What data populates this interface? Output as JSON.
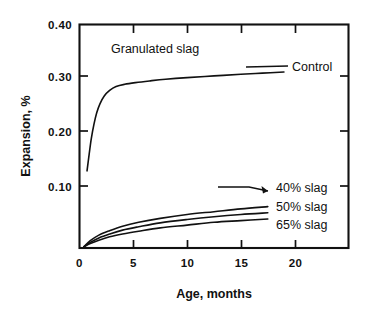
{
  "chart_data": {
    "type": "line",
    "title": "",
    "xlabel": "Age, months",
    "ylabel": "Expansion, %",
    "xlim": [
      0,
      25
    ],
    "ylim": [
      0.0,
      0.4
    ],
    "xticks": [
      0,
      5,
      10,
      15,
      20
    ],
    "xticklabels": [
      "0",
      "5",
      "10",
      "15",
      "20"
    ],
    "yticks": [
      0.1,
      0.2,
      0.3,
      0.4
    ],
    "yticklabels": [
      "0.10",
      "0.20",
      "0.30",
      "0.40"
    ],
    "grid": false,
    "legend_position": "inline-annotations",
    "annotations": [
      {
        "name": "granulated-slag",
        "text": "Granulated slag",
        "x": 3.2,
        "y": 0.358
      },
      {
        "name": "control",
        "text": "Control",
        "x": 19.6,
        "y": 0.318
      },
      {
        "name": "slag-40",
        "text": "40% slag",
        "x": 17.9,
        "y": 0.103
      },
      {
        "name": "slag-50",
        "text": "50% slag",
        "x": 17.9,
        "y": 0.069
      },
      {
        "name": "slag-65",
        "text": "65% slag",
        "x": 17.9,
        "y": 0.045
      }
    ],
    "series": [
      {
        "name": "Control",
        "label": "Control",
        "x": [
          0.7,
          0.9,
          1.1,
          1.35,
          1.6,
          1.9,
          2.3,
          2.8,
          3.4,
          4.2,
          5.2,
          6.5,
          8.0,
          10.0,
          12.5,
          15.0,
          17.0,
          19.0
        ],
        "values": [
          0.138,
          0.168,
          0.196,
          0.222,
          0.242,
          0.258,
          0.272,
          0.282,
          0.289,
          0.293,
          0.296,
          0.299,
          0.302,
          0.305,
          0.308,
          0.311,
          0.313,
          0.315
        ]
      },
      {
        "name": "40% slag",
        "label": "40% slag",
        "x": [
          0.4,
          1.0,
          1.8,
          2.8,
          4.0,
          5.5,
          7.5,
          10.0,
          12.5,
          15.0,
          17.5
        ],
        "values": [
          0.002,
          0.013,
          0.023,
          0.031,
          0.039,
          0.046,
          0.053,
          0.06,
          0.065,
          0.07,
          0.074
        ]
      },
      {
        "name": "50% slag",
        "label": "50% slag",
        "x": [
          0.4,
          1.0,
          1.8,
          2.8,
          4.0,
          5.5,
          7.5,
          10.0,
          12.5,
          15.0,
          17.5
        ],
        "values": [
          0.002,
          0.01,
          0.018,
          0.025,
          0.032,
          0.038,
          0.045,
          0.051,
          0.056,
          0.06,
          0.063
        ]
      },
      {
        "name": "65% slag",
        "label": "65% slag",
        "x": [
          0.4,
          1.0,
          1.8,
          2.8,
          4.0,
          5.5,
          7.5,
          10.0,
          12.5,
          15.0,
          17.5
        ],
        "values": [
          0.002,
          0.008,
          0.014,
          0.02,
          0.025,
          0.03,
          0.036,
          0.041,
          0.046,
          0.049,
          0.052
        ]
      }
    ],
    "colors": {
      "line": "#111111",
      "axis": "#111111",
      "background": "#ffffff"
    }
  },
  "axes": {
    "y_label": "Expansion, %",
    "x_label": "Age, months",
    "y_tick_0": "0.40",
    "y_tick_1": "0.30",
    "y_tick_2": "0.20",
    "y_tick_3": "0.10",
    "x_tick_0": "0",
    "x_tick_1": "5",
    "x_tick_2": "10",
    "x_tick_3": "15",
    "x_tick_4": "20"
  },
  "labels": {
    "granulated_slag": "Granulated slag",
    "control": "Control",
    "slag_40": "40% slag",
    "slag_50": "50% slag",
    "slag_65": "65% slag"
  }
}
